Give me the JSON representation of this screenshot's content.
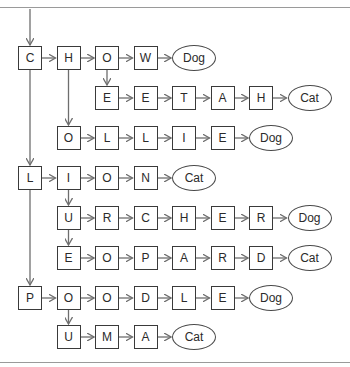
{
  "diagram": {
    "type": "trie",
    "colors": {
      "box_border": "#3a3a3a",
      "arrow": "#6e6e6e",
      "rule": "#9a9a9a",
      "text": "#2a2a2a"
    },
    "rows": [
      {
        "id": "r0",
        "start_col": 0,
        "letters": [
          "C",
          "H",
          "O",
          "W"
        ],
        "leaf": "Dog"
      },
      {
        "id": "r1",
        "start_col": 2,
        "letters": [
          "E",
          "E",
          "T",
          "A",
          "H"
        ],
        "leaf": "Cat"
      },
      {
        "id": "r2",
        "start_col": 1,
        "letters": [
          "O",
          "L",
          "L",
          "I",
          "E"
        ],
        "leaf": "Dog"
      },
      {
        "id": "r3",
        "start_col": 0,
        "letters": [
          "L",
          "I",
          "O",
          "N"
        ],
        "leaf": "Cat"
      },
      {
        "id": "r4",
        "start_col": 1,
        "letters": [
          "U",
          "R",
          "C",
          "H",
          "E",
          "R"
        ],
        "leaf": "Dog"
      },
      {
        "id": "r5",
        "start_col": 1,
        "letters": [
          "E",
          "O",
          "P",
          "A",
          "R",
          "D"
        ],
        "leaf": "Cat"
      },
      {
        "id": "r6",
        "start_col": 0,
        "letters": [
          "P",
          "O",
          "O",
          "D",
          "L",
          "E"
        ],
        "leaf": "Dog"
      },
      {
        "id": "r7",
        "start_col": 1,
        "letters": [
          "U",
          "M",
          "A"
        ],
        "leaf": "Cat"
      }
    ],
    "branches": [
      {
        "from": "r0 col0 (C)",
        "to": "r3 col0 (L)"
      },
      {
        "from": "r3 col0 (L)",
        "to": "r6 col0 (P)"
      },
      {
        "from": "r0 col1 (H)",
        "to": "r2 col1 (O)"
      },
      {
        "from": "r0 col2 (O)",
        "to": "r1 col2 (E)"
      },
      {
        "from": "r3 col1 (I)",
        "to": "r4 col1 (U)"
      },
      {
        "from": "r4 col1 (U)",
        "to": "r5 col1 (E)"
      },
      {
        "from": "r6 col1 (O)",
        "to": "r7 col1 (U)"
      }
    ],
    "words": [
      "CHOW → Dog",
      "CHEETAH → Cat",
      "COLLIE → Dog",
      "LION → Cat",
      "LURCHER → Dog",
      "LEOPARD → Cat",
      "POODLE → Dog",
      "PUMA → Cat"
    ]
  }
}
